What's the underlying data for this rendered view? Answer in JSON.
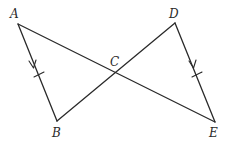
{
  "diagram": {
    "type": "geometry",
    "points": {
      "A": {
        "label": "A",
        "x": 18,
        "y": 24
      },
      "B": {
        "label": "B",
        "x": 57,
        "y": 121
      },
      "C": {
        "label": "C",
        "x": 114,
        "y": 70
      },
      "D": {
        "label": "D",
        "x": 175,
        "y": 23
      },
      "E": {
        "label": "E",
        "x": 215,
        "y": 122
      }
    },
    "segments": [
      {
        "from": "A",
        "to": "B",
        "marks": [
          "parallel-arrow",
          "congruence-tick"
        ]
      },
      {
        "from": "A",
        "to": "E",
        "marks": []
      },
      {
        "from": "B",
        "to": "D",
        "marks": []
      },
      {
        "from": "D",
        "to": "E",
        "marks": [
          "parallel-arrow",
          "congruence-tick"
        ]
      }
    ],
    "labels": {
      "A": "A",
      "B": "B",
      "C": "C",
      "D": "D",
      "E": "E"
    },
    "colors": {
      "stroke": "#2a2a2a",
      "background": "#ffffff"
    }
  }
}
